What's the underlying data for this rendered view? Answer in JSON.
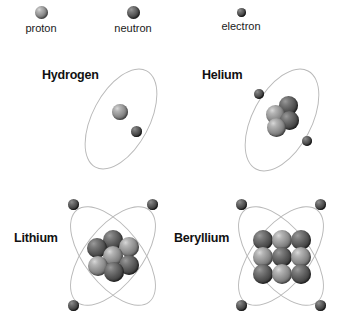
{
  "legend": {
    "items": [
      {
        "key": "proton",
        "label": "proton",
        "icon": "proton-sphere",
        "size_px": 13,
        "color": "#8e8e8e"
      },
      {
        "key": "neutron",
        "label": "neutron",
        "icon": "neutron-sphere",
        "size_px": 13,
        "color": "#555555"
      },
      {
        "key": "electron",
        "label": "electron",
        "icon": "electron-sphere",
        "size_px": 9,
        "color": "#4a4a4a"
      }
    ]
  },
  "atoms": [
    {
      "key": "hydrogen",
      "label": "Hydrogen",
      "protons": 1,
      "neutrons": 0,
      "electrons": 1,
      "orbit_count": 1,
      "nucleus_layout": "single"
    },
    {
      "key": "helium",
      "label": "Helium",
      "protons": 2,
      "neutrons": 2,
      "electrons": 2,
      "orbit_count": 1,
      "nucleus_layout": "diamond-4"
    },
    {
      "key": "lithium",
      "label": "Lithium",
      "protons": 3,
      "neutrons": 4,
      "electrons": 3,
      "orbit_count": 2,
      "nucleus_layout": "hex-7"
    },
    {
      "key": "beryllium",
      "label": "Beryllium",
      "protons": 4,
      "neutrons": 5,
      "electrons": 4,
      "orbit_count": 2,
      "nucleus_layout": "grid-3x3"
    }
  ],
  "colors": {
    "background": "#ffffff",
    "orbit_line": "#b9b9b9",
    "text": "#111111",
    "proton": "#8e8e8e",
    "neutron": "#555555",
    "electron": "#4a4a4a"
  }
}
